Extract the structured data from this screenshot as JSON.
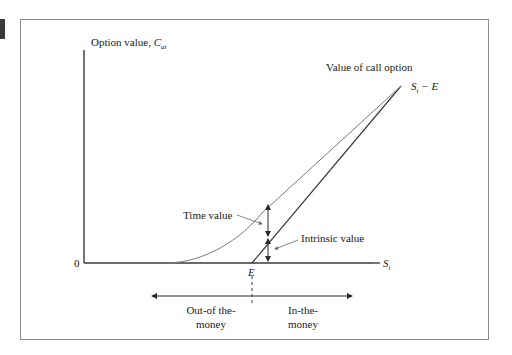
{
  "figure": {
    "y_axis_label": "Option value, ",
    "y_axis_symbol": "C",
    "y_axis_subscript": "at",
    "x_axis_symbol": "S",
    "x_axis_subscript": "t",
    "origin_label": "0",
    "curve_label": "Value of call option",
    "line_label_symbol": "S",
    "line_label_subscript": "t",
    "line_label_suffix": " − E",
    "time_value_label": "Time value",
    "intrinsic_value_label": "Intrinsic value",
    "strike_label": "E",
    "out_of_money_line1": "Out-of the-",
    "out_of_money_line2": "money",
    "in_money_line1": "In-the-",
    "in_money_line2": "money"
  },
  "colors": {
    "axis": "#3a3a3a",
    "curve": "#7a7a7a",
    "frame": "#8c8c8c"
  }
}
